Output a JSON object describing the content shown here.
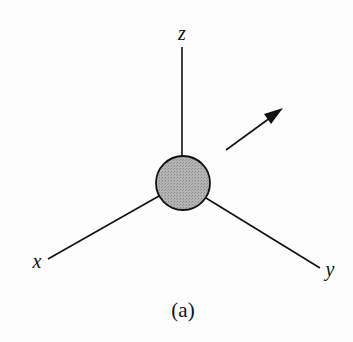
{
  "diagram": {
    "type": "3d-coordinate-axes-with-sphere",
    "axes": {
      "z": {
        "label": "z"
      },
      "x": {
        "label": "x"
      },
      "y": {
        "label": "y"
      }
    },
    "sphere": {
      "fill": "#a8a8a8",
      "stroke": "#111111"
    },
    "arrow": {
      "direction": "upper-right",
      "color": "#111111"
    },
    "caption": "(a)"
  }
}
